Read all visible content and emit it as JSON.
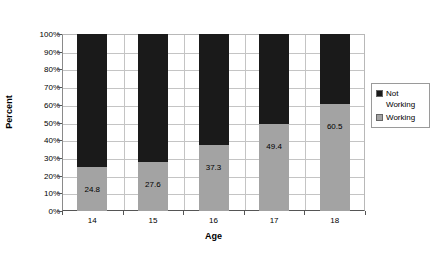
{
  "chart_data": {
    "type": "bar",
    "subtype": "100% stacked bar",
    "title": "",
    "xlabel": "Age",
    "ylabel": "Percent",
    "categories": [
      "14",
      "15",
      "16",
      "17",
      "18"
    ],
    "series": [
      {
        "name": "Not Working",
        "color": "#1a1a1a",
        "values": [
          75.2,
          72.4,
          62.7,
          50.6,
          39.5
        ],
        "labels_shown": false
      },
      {
        "name": "Working",
        "color": "#a3a3a3",
        "values": [
          24.8,
          27.6,
          37.3,
          49.4,
          60.5
        ],
        "labels_shown": true,
        "value_labels": [
          "24.8",
          "27.6",
          "37.3",
          "49.4",
          "60.5"
        ]
      }
    ],
    "ylim": [
      0,
      100
    ],
    "ytick_labels": [
      "100%",
      "90%",
      "80%",
      "70%",
      "60%",
      "50%",
      "40%",
      "30%",
      "20%",
      "10%",
      "0%"
    ],
    "ytick_values": [
      100,
      90,
      80,
      70,
      60,
      50,
      40,
      30,
      20,
      10,
      0
    ],
    "grid": "horizontal-and-vertical",
    "legend_position": "right",
    "stack_order_bottom_to_top": [
      "Working",
      "Not Working"
    ]
  },
  "legend": {
    "entries": [
      {
        "label": "Not Working",
        "color": "#1a1a1a"
      },
      {
        "label": "Working",
        "color": "#a3a3a3"
      }
    ]
  },
  "axes": {
    "y_title": "Percent",
    "x_title": "Age"
  }
}
